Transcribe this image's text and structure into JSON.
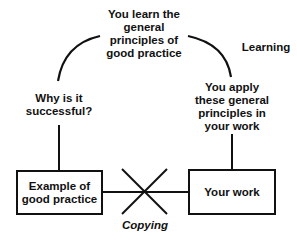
{
  "diagram": {
    "top_node": "You learn the\ngeneral\nprinciples of\ngood practice",
    "left_node": "Why is it\nsuccessful?",
    "right_node": "You apply\nthese general\nprinciples in\nyour work",
    "cycle_label": "Learning",
    "box_left": "Example of\ngood practice",
    "box_right": "Your work",
    "crossed_link_label": "Copying"
  }
}
